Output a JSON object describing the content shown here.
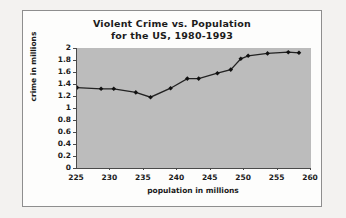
{
  "chart_data": {
    "type": "line",
    "title": "Violent Crime vs. Population",
    "subtitle": "for the US, 1980-1993",
    "title_line1": "Violent Crime vs. Population",
    "title_line2": "for the US, 1980-1993",
    "xlabel": "population in millions",
    "ylabel": "crime in millions",
    "xlim": [
      225,
      260
    ],
    "ylim": [
      0,
      2
    ],
    "xticks": [
      225,
      230,
      235,
      240,
      245,
      250,
      255,
      260
    ],
    "yticks": [
      0,
      0.2,
      0.4,
      0.6,
      0.8,
      1,
      1.2,
      1.4,
      1.6,
      1.8,
      2
    ],
    "xtick_labels": [
      "225",
      "230",
      "235",
      "240",
      "245",
      "250",
      "255",
      "260"
    ],
    "ytick_labels": [
      "0",
      "0.2",
      "0.4",
      "0.6",
      "0.8",
      "1",
      "1.2",
      "1.4",
      "1.6",
      "1.8",
      "2"
    ],
    "grid": false,
    "legend": false,
    "marker": "filled-diamond",
    "line_color": "#222222",
    "marker_color": "#111111",
    "plot_background": "#bcbcbc",
    "figure_background": "#fdfdfc",
    "series": [
      {
        "name": "Violent crime",
        "x": [
          225.0,
          228.6,
          230.5,
          233.8,
          236.0,
          239.0,
          241.5,
          243.2,
          246.0,
          248.0,
          249.5,
          250.6,
          253.5,
          256.6,
          258.2
        ],
        "y": [
          1.34,
          1.32,
          1.32,
          1.26,
          1.18,
          1.33,
          1.49,
          1.49,
          1.58,
          1.64,
          1.82,
          1.87,
          1.91,
          1.93,
          1.92
        ]
      }
    ]
  }
}
